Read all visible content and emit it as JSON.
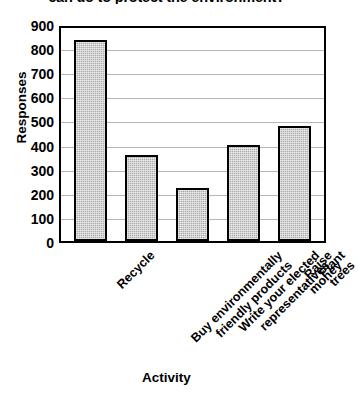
{
  "chart_data": {
    "type": "bar",
    "title": "can do to protect the environment?",
    "xlabel": "Activity",
    "ylabel": "Responses",
    "categories": [
      "Recycle",
      "Buy environmentally\nfriendly products",
      "Write your elected\nrepresentatives",
      "Raise money",
      "Plant trees"
    ],
    "values": [
      840,
      360,
      220,
      400,
      480
    ],
    "ylim": [
      0,
      900
    ],
    "ytick_labels": [
      "900",
      "800",
      "700",
      "600",
      "500",
      "400",
      "300",
      "200",
      "100",
      "0"
    ],
    "ytick_values": [
      900,
      800,
      700,
      600,
      500,
      400,
      300,
      200,
      100,
      0
    ],
    "grid": true,
    "legend": "none",
    "bar_fill_color": "#ababab",
    "bar_border_color": "#000000",
    "gridline_color": "#b5b5b5"
  }
}
